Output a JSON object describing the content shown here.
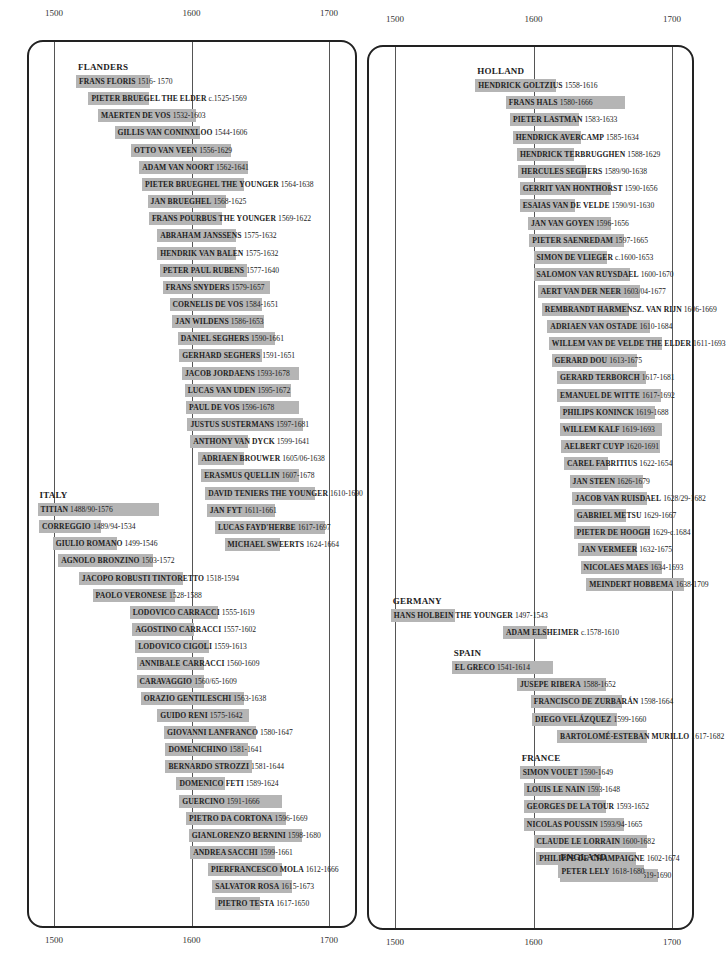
{
  "chart_data": {
    "type": "bar",
    "subtype": "timeline (horizontal floating bars, lifespans of painters)",
    "x_axis": {
      "ticks": [
        1500,
        1600,
        1700
      ],
      "range": [
        1480,
        1720
      ]
    },
    "panels": [
      {
        "id": "left",
        "groups": [
          {
            "region": "FLANDERS",
            "artists": [
              {
                "name": "FRANS FLORIS",
                "dates": "1516- 1570",
                "start": 1516,
                "end": 1570
              },
              {
                "name": "PIETER BRUEGEL THE ELDER",
                "dates": "c.1525-1569",
                "start": 1525,
                "end": 1569
              },
              {
                "name": "MAERTEN DE VOS",
                "dates": "1532-1603",
                "start": 1532,
                "end": 1603
              },
              {
                "name": "GILLIS VAN CONINXLOO",
                "dates": "1544-1606",
                "start": 1544,
                "end": 1606
              },
              {
                "name": "OTTO VAN VEEN",
                "dates": "1556-1629",
                "start": 1556,
                "end": 1629
              },
              {
                "name": "ADAM VAN NOORT",
                "dates": "1562-1641",
                "start": 1562,
                "end": 1641
              },
              {
                "name": "PIETER BRUEGHEL THE YOUNGER",
                "dates": "1564-1638",
                "start": 1564,
                "end": 1638
              },
              {
                "name": "JAN BRUEGHEL",
                "dates": "1568-1625",
                "start": 1568,
                "end": 1625
              },
              {
                "name": "FRANS POURBUS THE YOUNGER",
                "dates": "1569-1622",
                "start": 1569,
                "end": 1622
              },
              {
                "name": "ABRAHAM JANSSENS",
                "dates": "1575-1632",
                "start": 1575,
                "end": 1632
              },
              {
                "name": "HENDRIK VAN BALEN",
                "dates": "1575-1632",
                "start": 1575,
                "end": 1632
              },
              {
                "name": "PETER PAUL RUBENS",
                "dates": "1577-1640",
                "start": 1577,
                "end": 1640
              },
              {
                "name": "FRANS SNYDERS",
                "dates": "1579-1657",
                "start": 1579,
                "end": 1657
              },
              {
                "name": "CORNELIS DE VOS",
                "dates": "1584-1651",
                "start": 1584,
                "end": 1651
              },
              {
                "name": "JAN WILDENS",
                "dates": "1586-1653",
                "start": 1586,
                "end": 1653
              },
              {
                "name": "DANIEL SEGHERS",
                "dates": "1590-1661",
                "start": 1590,
                "end": 1661
              },
              {
                "name": "GERHARD SEGHERS",
                "dates": "1591-1651",
                "start": 1591,
                "end": 1651
              },
              {
                "name": "JACOB JORDAENS",
                "dates": "1593-1678",
                "start": 1593,
                "end": 1678
              },
              {
                "name": "LUCAS VAN UDEN",
                "dates": "1595-1672",
                "start": 1595,
                "end": 1672
              },
              {
                "name": "PAUL DE VOS",
                "dates": "1596-1678",
                "start": 1596,
                "end": 1678
              },
              {
                "name": "JUSTUS SUSTERMANS",
                "dates": "1597-1681",
                "start": 1597,
                "end": 1681
              },
              {
                "name": "ANTHONY VAN DYCK",
                "dates": "1599-1641",
                "start": 1599,
                "end": 1641
              },
              {
                "name": "ADRIAEN BROUWER",
                "dates": "1605/06-1638",
                "start": 1605,
                "end": 1638
              },
              {
                "name": "ERASMUS QUELLIN",
                "dates": "1607-1678",
                "start": 1607,
                "end": 1678
              },
              {
                "name": "DAVID TENIERS THE YOUNGER",
                "dates": "1610-1690",
                "start": 1610,
                "end": 1690
              },
              {
                "name": "JAN FYT",
                "dates": "1611-1661",
                "start": 1611,
                "end": 1661
              },
              {
                "name": "LUCAS FAYD'HERBE",
                "dates": "1617-1697",
                "start": 1617,
                "end": 1697
              },
              {
                "name": "MICHAEL SWEERTS",
                "dates": "1624-1664",
                "start": 1624,
                "end": 1664
              }
            ]
          },
          {
            "region": "ITALY",
            "artists": [
              {
                "name": "TITIAN",
                "dates": "1488/90-1576",
                "start": 1488,
                "end": 1576
              },
              {
                "name": "CORREGGIO",
                "dates": "1489/94-1534",
                "start": 1489,
                "end": 1534
              },
              {
                "name": "GIULIO ROMANO",
                "dates": "1499-1546",
                "start": 1499,
                "end": 1546
              },
              {
                "name": "AGNOLO BRONZINO",
                "dates": "1503-1572",
                "start": 1503,
                "end": 1572
              },
              {
                "name": "JACOPO ROBUSTI TINTORETTO",
                "dates": "1518-1594",
                "start": 1518,
                "end": 1594
              },
              {
                "name": "PAOLO VERONESE",
                "dates": "1528-1588",
                "start": 1528,
                "end": 1588
              },
              {
                "name": "LODOVICO CARRACCI",
                "dates": "1555-1619",
                "start": 1555,
                "end": 1619
              },
              {
                "name": "AGOSTINO CARRACCI",
                "dates": "1557-1602",
                "start": 1557,
                "end": 1602
              },
              {
                "name": "LODOVICO CIGOLI",
                "dates": "1559-1613",
                "start": 1559,
                "end": 1613
              },
              {
                "name": "ANNIBALE CARRACCI",
                "dates": "1560-1609",
                "start": 1560,
                "end": 1609
              },
              {
                "name": "CARAVAGGIO",
                "dates": "1560/65-1609",
                "start": 1560,
                "end": 1609
              },
              {
                "name": "ORAZIO GENTILESCHI",
                "dates": "1563-1638",
                "start": 1563,
                "end": 1638
              },
              {
                "name": "GUIDO RENI",
                "dates": "1575-1642",
                "start": 1575,
                "end": 1642
              },
              {
                "name": "GIOVANNI LANFRANCO",
                "dates": "1580-1647",
                "start": 1580,
                "end": 1647
              },
              {
                "name": "DOMENICHINO",
                "dates": "1581-1641",
                "start": 1581,
                "end": 1641
              },
              {
                "name": "BERNARDO STROZZI",
                "dates": "1581-1644",
                "start": 1581,
                "end": 1644
              },
              {
                "name": "DOMENICO FETI",
                "dates": "1589-1624",
                "start": 1589,
                "end": 1624
              },
              {
                "name": "GUERCINO",
                "dates": "1591-1666",
                "start": 1591,
                "end": 1666
              },
              {
                "name": "PIETRO DA CORTONA",
                "dates": "1596-1669",
                "start": 1596,
                "end": 1669
              },
              {
                "name": "GIANLORENZO BERNINI",
                "dates": "1598-1680",
                "start": 1598,
                "end": 1680
              },
              {
                "name": "ANDREA SACCHI",
                "dates": "1599-1661",
                "start": 1599,
                "end": 1661
              },
              {
                "name": "PIERFRANCESCO MOLA",
                "dates": "1612-1666",
                "start": 1612,
                "end": 1666
              },
              {
                "name": "SALVATOR ROSA",
                "dates": "1615-1673",
                "start": 1615,
                "end": 1673
              },
              {
                "name": "PIETRO TESTA",
                "dates": "1617-1650",
                "start": 1617,
                "end": 1650
              }
            ]
          }
        ]
      },
      {
        "id": "right",
        "groups": [
          {
            "region": "HOLLAND",
            "artists": [
              {
                "name": "HENDRICK GOLTZIUS",
                "dates": "1558-1616",
                "start": 1558,
                "end": 1616
              },
              {
                "name": "FRANS HALS",
                "dates": "1580-1666",
                "start": 1580,
                "end": 1666
              },
              {
                "name": "PIETER LASTMAN",
                "dates": "1583-1633",
                "start": 1583,
                "end": 1633
              },
              {
                "name": "HENDRICK AVERCAMP",
                "dates": "1585-1634",
                "start": 1585,
                "end": 1634
              },
              {
                "name": "HENDRICK TERBRUGGHEN",
                "dates": "1588-1629",
                "start": 1588,
                "end": 1629
              },
              {
                "name": "HERCULES SEGHERS",
                "dates": "1589/90-1638",
                "start": 1589,
                "end": 1638
              },
              {
                "name": "GERRIT VAN HONTHORST",
                "dates": "1590-1656",
                "start": 1590,
                "end": 1656
              },
              {
                "name": "ESAIAS VAN DE VELDE",
                "dates": "1590/91-1630",
                "start": 1590,
                "end": 1630
              },
              {
                "name": "JAN VAN GOYEN",
                "dates": "1596-1656",
                "start": 1596,
                "end": 1656
              },
              {
                "name": "PIETER SAENREDAM",
                "dates": "1597-1665",
                "start": 1597,
                "end": 1665
              },
              {
                "name": "SIMON DE VLIEGER",
                "dates": "c.1600-1653",
                "start": 1600,
                "end": 1653
              },
              {
                "name": "SALOMON VAN RUYSDAEL",
                "dates": "1600-1670",
                "start": 1600,
                "end": 1670
              },
              {
                "name": "AERT VAN DER NEER",
                "dates": "1603/04-1677",
                "start": 1603,
                "end": 1677
              },
              {
                "name": "REMBRANDT HARMENSZ. VAN RIJN",
                "dates": "1606-1669",
                "start": 1606,
                "end": 1669
              },
              {
                "name": "ADRIAEN VAN OSTADE",
                "dates": "1610-1684",
                "start": 1610,
                "end": 1684
              },
              {
                "name": "WILLEM VAN DE VELDE THE ELDER",
                "dates": "1611-1693",
                "start": 1611,
                "end": 1693
              },
              {
                "name": "GERARD DOU",
                "dates": "1613-1675",
                "start": 1613,
                "end": 1675
              },
              {
                "name": "GERARD TERBORCH",
                "dates": "1617-1681",
                "start": 1617,
                "end": 1681
              },
              {
                "name": "EMANUEL DE WITTE",
                "dates": "1617-1692",
                "start": 1617,
                "end": 1692
              },
              {
                "name": "PHILIPS KONINCK",
                "dates": "1619-1688",
                "start": 1619,
                "end": 1688
              },
              {
                "name": "WILLEM KALF",
                "dates": "1619-1693",
                "start": 1619,
                "end": 1693
              },
              {
                "name": "AELBERT CUYP",
                "dates": "1620-1691",
                "start": 1620,
                "end": 1691
              },
              {
                "name": "CAREL FABRITIUS",
                "dates": "1622-1654",
                "start": 1622,
                "end": 1654
              },
              {
                "name": "JAN STEEN",
                "dates": "1626-1679",
                "start": 1626,
                "end": 1679
              },
              {
                "name": "JACOB VAN RUISDAEL",
                "dates": "1628/29-1682",
                "start": 1628,
                "end": 1682
              },
              {
                "name": "GABRIEL METSU",
                "dates": "1629-1667",
                "start": 1629,
                "end": 1667
              },
              {
                "name": "PIETER DE HOOGH",
                "dates": "1629-c.1684",
                "start": 1629,
                "end": 1684
              },
              {
                "name": "JAN VERMEER",
                "dates": "1632-1675",
                "start": 1632,
                "end": 1675
              },
              {
                "name": "NICOLAES MAES",
                "dates": "1634-1693",
                "start": 1634,
                "end": 1693
              },
              {
                "name": "MEINDERT HOBBEMA",
                "dates": "1638-1709",
                "start": 1638,
                "end": 1709
              }
            ]
          },
          {
            "region": "GERMANY",
            "artists": [
              {
                "name": "HANS HOLBEIN THE YOUNGER",
                "dates": "1497-1543",
                "start": 1497,
                "end": 1543
              },
              {
                "name": "ADAM ELSHEIMER",
                "dates": "c.1578-1610",
                "start": 1578,
                "end": 1610
              }
            ]
          },
          {
            "region": "SPAIN",
            "artists": [
              {
                "name": "EL GRECO",
                "dates": "1541-1614",
                "start": 1541,
                "end": 1614
              },
              {
                "name": "JUSEPE RIBERA",
                "dates": "1588-1652",
                "start": 1588,
                "end": 1652
              },
              {
                "name": "FRANCISCO DE ZURBARÁN",
                "dates": "1598-1664",
                "start": 1598,
                "end": 1664
              },
              {
                "name": "DIEGO VELÁZQUEZ",
                "dates": "1599-1660",
                "start": 1599,
                "end": 1660
              },
              {
                "name": "BARTOLOMÉ-ESTEBAN MURILLO",
                "dates": "1617-1682",
                "start": 1617,
                "end": 1682
              }
            ]
          },
          {
            "region": "FRANCE",
            "artists": [
              {
                "name": "SIMON VOUET",
                "dates": "1590-1649",
                "start": 1590,
                "end": 1649
              },
              {
                "name": "LOUIS LE NAIN",
                "dates": "1593-1648",
                "start": 1593,
                "end": 1648
              },
              {
                "name": "GEORGES DE LA TOUR",
                "dates": "1593-1652",
                "start": 1593,
                "end": 1652
              },
              {
                "name": "NICOLAS POUSSIN",
                "dates": "1593/94-1665",
                "start": 1593,
                "end": 1665
              },
              {
                "name": "CLAUDE LE LORRAIN",
                "dates": "1600-1682",
                "start": 1600,
                "end": 1682
              },
              {
                "name": "PHILIPPE DE CHAMPAIGNE",
                "dates": "1602-1674",
                "start": 1602,
                "end": 1674
              },
              {
                "name": "CHARLES LE BRUN",
                "dates": "1619-1690",
                "start": 1619,
                "end": 1690
              }
            ]
          },
          {
            "region": "ENGLAND",
            "artists": [
              {
                "name": "PETER LELY",
                "dates": "1618-1680",
                "start": 1618,
                "end": 1680
              }
            ]
          }
        ]
      }
    ],
    "colors": {
      "bar": "#b5b5b5",
      "frame": "#222222",
      "gridline": "#555555"
    },
    "grid": true,
    "legend": null
  },
  "footer": {
    "text": "Painters shown by country and lifespan"
  }
}
